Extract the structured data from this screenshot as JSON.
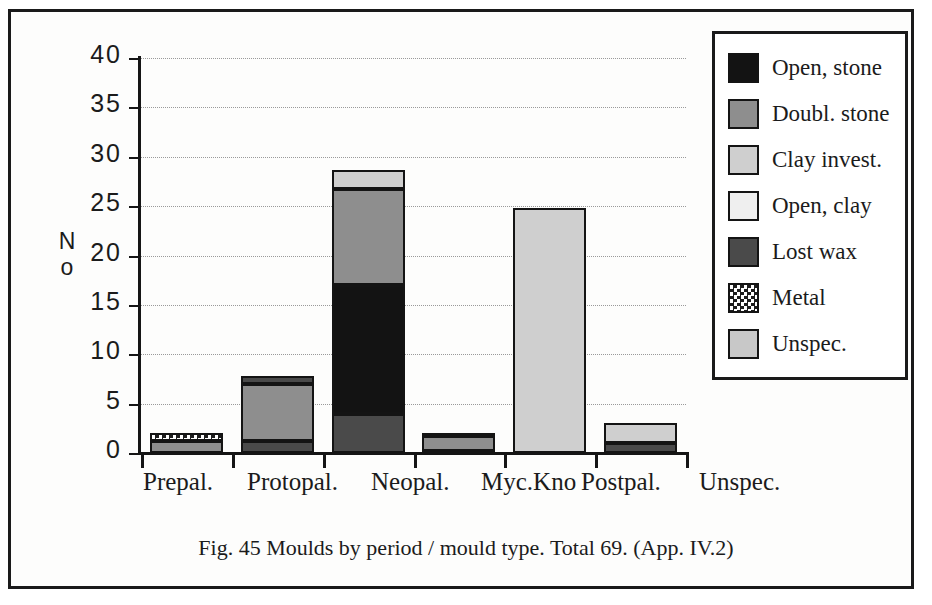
{
  "figure": {
    "caption": "Fig. 45  Moulds by period / mould type.  Total  69. (App. IV.2)"
  },
  "chart_data": {
    "type": "bar",
    "subtype": "stacked-bar",
    "title": "",
    "xlabel": "",
    "ylabel": "No",
    "ylim": [
      0,
      40
    ],
    "yticks": [
      0,
      5,
      10,
      15,
      20,
      25,
      30,
      35,
      40
    ],
    "ytick_labels": [
      "0",
      "5",
      "10",
      "15",
      "20",
      "25",
      "30",
      "35",
      "40"
    ],
    "grid": true,
    "grid_axis": "y",
    "legend_position": "right",
    "categories": [
      "Prepal.",
      "Protopal.",
      "Neopal.",
      "Myc.Kno",
      "Postpal.",
      "Unspec."
    ],
    "series": [
      {
        "name": "Open, stone",
        "color": "#131313",
        "values": [
          0,
          0,
          13,
          0,
          0,
          0
        ]
      },
      {
        "name": "Doubl. stone",
        "color": "#8e8e8e",
        "values": [
          1.2,
          5.8,
          9.7,
          1.5,
          0,
          0
        ]
      },
      {
        "name": "Clay invest.",
        "color": "#cfcfcf",
        "values": [
          0,
          0,
          2,
          0,
          24.8,
          2
        ]
      },
      {
        "name": "Open, clay",
        "color": "#efefef",
        "values": [
          0,
          0,
          0,
          0.3,
          0,
          0
        ]
      },
      {
        "name": "Lost  wax",
        "color": "#4a4a4a",
        "values": [
          0,
          2,
          4,
          0.2,
          0,
          1
        ]
      },
      {
        "name": "Metal",
        "color": "#ffffff",
        "values": [
          0.8,
          0,
          0,
          0,
          0,
          0
        ]
      },
      {
        "name": "Unspec.",
        "color": "#c8c8c8",
        "values": [
          0,
          0,
          0,
          0,
          0,
          0
        ]
      }
    ],
    "totals": [
      2,
      7.8,
      28.7,
      2,
      24.8,
      3
    ],
    "total_label": "69"
  },
  "legend": {
    "items": [
      {
        "label": "Open, stone",
        "swatch": "open-stone-swatch"
      },
      {
        "label": "Doubl. stone",
        "swatch": "doubl-stone-swatch"
      },
      {
        "label": "Clay invest.",
        "swatch": "clay-invest-swatch"
      },
      {
        "label": "Open, clay",
        "swatch": "open-clay-swatch"
      },
      {
        "label": "Lost  wax",
        "swatch": "lost-wax-swatch"
      },
      {
        "label": "Metal",
        "swatch": "metal-swatch"
      },
      {
        "label": "Unspec.",
        "swatch": "unspec-swatch"
      }
    ]
  }
}
